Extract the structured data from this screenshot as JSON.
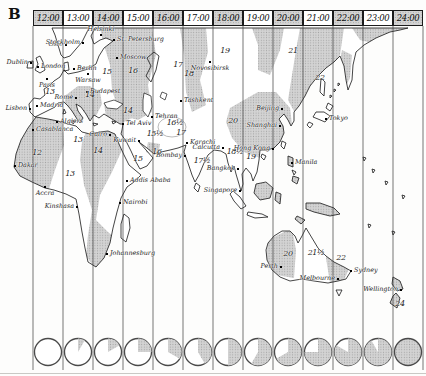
{
  "plate_label": "B",
  "colors": {
    "shade_base": "#d3d3d3",
    "shade_dot": "#a5a5a5",
    "coastline": "#151515",
    "zone_line": "#3a3a3a",
    "clock_ring": "#4a4a4a"
  },
  "timezone_header": {
    "labels": [
      {
        "time": "12:00",
        "shaded": true
      },
      {
        "time": "13:00",
        "shaded": false
      },
      {
        "time": "14:00",
        "shaded": true
      },
      {
        "time": "15:00",
        "shaded": false
      },
      {
        "time": "16:00",
        "shaded": true
      },
      {
        "time": "17:00",
        "shaded": false
      },
      {
        "time": "18:00",
        "shaded": true
      },
      {
        "time": "19:00",
        "shaded": false
      },
      {
        "time": "20:00",
        "shaded": true
      },
      {
        "time": "21:00",
        "shaded": false
      },
      {
        "time": "22:00",
        "shaded": true
      },
      {
        "time": "23:00",
        "shaded": false
      },
      {
        "time": "24:00",
        "shaded": true
      }
    ]
  },
  "map": {
    "cities": [
      {
        "name": "Oslo",
        "x": 66,
        "y": 45,
        "side": "left"
      },
      {
        "name": "Stockholm",
        "x": 83,
        "y": 43,
        "side": "left"
      },
      {
        "name": "Helsinki",
        "x": 101,
        "y": 35,
        "side": "above"
      },
      {
        "name": "St. Petersburg",
        "x": 114,
        "y": 40,
        "side": "right"
      },
      {
        "name": "Moscow",
        "x": 117,
        "y": 58,
        "side": "right"
      },
      {
        "name": "Dublin",
        "x": 31,
        "y": 63,
        "side": "left"
      },
      {
        "name": "London",
        "x": 38,
        "y": 67,
        "side": "right"
      },
      {
        "name": "Berlin",
        "x": 74,
        "y": 69,
        "side": "right"
      },
      {
        "name": "Warsaw",
        "x": 88,
        "y": 74,
        "side": "below"
      },
      {
        "name": "Paris",
        "x": 47,
        "y": 79,
        "side": "below"
      },
      {
        "name": "Budapest",
        "x": 87,
        "y": 92,
        "side": "right"
      },
      {
        "name": "Rome",
        "x": 76,
        "y": 98,
        "side": "left"
      },
      {
        "name": "Madrid",
        "x": 37,
        "y": 106,
        "side": "right"
      },
      {
        "name": "Lisbon",
        "x": 30,
        "y": 109,
        "side": "left"
      },
      {
        "name": "Algiers",
        "x": 57,
        "y": 122,
        "side": "right"
      },
      {
        "name": "Casablanca",
        "x": 33,
        "y": 130,
        "side": "right"
      },
      {
        "name": "Cairo",
        "x": 110,
        "y": 135,
        "side": "left"
      },
      {
        "name": "Tel Aviv",
        "x": 123,
        "y": 124,
        "side": "right"
      },
      {
        "name": "Kuwait",
        "x": 139,
        "y": 141,
        "side": "left"
      },
      {
        "name": "Dakar",
        "x": 15,
        "y": 166,
        "side": "right"
      },
      {
        "name": "Accra",
        "x": 45,
        "y": 187,
        "side": "below"
      },
      {
        "name": "Kinshasa",
        "x": 77,
        "y": 207,
        "side": "left"
      },
      {
        "name": "Nairobi",
        "x": 120,
        "y": 203,
        "side": "right"
      },
      {
        "name": "Addis Ababa",
        "x": 127,
        "y": 181,
        "side": "right"
      },
      {
        "name": "Johannesburg",
        "x": 107,
        "y": 254,
        "side": "right"
      },
      {
        "name": "Tashkent",
        "x": 181,
        "y": 101,
        "side": "right"
      },
      {
        "name": "Tehran",
        "x": 152,
        "y": 117,
        "side": "right"
      },
      {
        "name": "Karachi",
        "x": 187,
        "y": 143,
        "side": "right"
      },
      {
        "name": "Calcutta",
        "x": 223,
        "y": 148,
        "side": "left"
      },
      {
        "name": "Bombay",
        "x": 185,
        "y": 156,
        "side": "left"
      },
      {
        "name": "Bangkok",
        "x": 238,
        "y": 169,
        "side": "left"
      },
      {
        "name": "Singapore",
        "x": 240,
        "y": 191,
        "side": "left"
      },
      {
        "name": "Novosibirsk",
        "x": 210,
        "y": 62,
        "side": "below"
      },
      {
        "name": "Beijing",
        "x": 282,
        "y": 109,
        "side": "left"
      },
      {
        "name": "Shanghai",
        "x": 280,
        "y": 126,
        "side": "left"
      },
      {
        "name": "Hong Kong",
        "x": 273,
        "y": 149,
        "side": "left"
      },
      {
        "name": "Tokyo",
        "x": 326,
        "y": 119,
        "side": "right"
      },
      {
        "name": "Manila",
        "x": 292,
        "y": 163,
        "side": "right"
      },
      {
        "name": "Perth",
        "x": 281,
        "y": 267,
        "side": "left"
      },
      {
        "name": "Sydney",
        "x": 351,
        "y": 271,
        "side": "right"
      },
      {
        "name": "Melbourne",
        "x": 338,
        "y": 279,
        "side": "left"
      },
      {
        "name": "Wellington",
        "x": 401,
        "y": 290,
        "side": "left"
      }
    ],
    "zone_numbers": [
      {
        "label": "12",
        "x": 37,
        "y": 152
      },
      {
        "label": "13",
        "x": 50,
        "y": 91
      },
      {
        "label": "13",
        "x": 78,
        "y": 139
      },
      {
        "label": "13",
        "x": 70,
        "y": 173
      },
      {
        "label": "14",
        "x": 90,
        "y": 94
      },
      {
        "label": "14",
        "x": 128,
        "y": 110
      },
      {
        "label": "14",
        "x": 98,
        "y": 150
      },
      {
        "label": "15",
        "x": 107,
        "y": 71
      },
      {
        "label": "15",
        "x": 138,
        "y": 158
      },
      {
        "label": "15½",
        "x": 155,
        "y": 133
      },
      {
        "label": "16",
        "x": 133,
        "y": 70
      },
      {
        "label": "16",
        "x": 157,
        "y": 151
      },
      {
        "label": "16½",
        "x": 175,
        "y": 122
      },
      {
        "label": "17",
        "x": 178,
        "y": 64
      },
      {
        "label": "17",
        "x": 181,
        "y": 132
      },
      {
        "label": "17½",
        "x": 202,
        "y": 160
      },
      {
        "label": "18",
        "x": 189,
        "y": 73
      },
      {
        "label": "18½",
        "x": 235,
        "y": 151
      },
      {
        "label": "19",
        "x": 225,
        "y": 50
      },
      {
        "label": "19",
        "x": 251,
        "y": 156
      },
      {
        "label": "20",
        "x": 233,
        "y": 120
      },
      {
        "label": "20",
        "x": 288,
        "y": 253
      },
      {
        "label": "21",
        "x": 293,
        "y": 50
      },
      {
        "label": "21½",
        "x": 316,
        "y": 252
      },
      {
        "label": "22",
        "x": 320,
        "y": 77
      },
      {
        "label": "22",
        "x": 341,
        "y": 257
      },
      {
        "label": "24",
        "x": 400,
        "y": 303
      }
    ]
  },
  "clock_row": {
    "clocks": [
      {
        "time": "12:00",
        "twelfths": 0
      },
      {
        "time": "13:00",
        "twelfths": 1
      },
      {
        "time": "14:00",
        "twelfths": 2
      },
      {
        "time": "15:00",
        "twelfths": 3
      },
      {
        "time": "16:00",
        "twelfths": 4
      },
      {
        "time": "17:00",
        "twelfths": 5
      },
      {
        "time": "18:00",
        "twelfths": 6
      },
      {
        "time": "19:00",
        "twelfths": 7
      },
      {
        "time": "20:00",
        "twelfths": 8
      },
      {
        "time": "21:00",
        "twelfths": 9
      },
      {
        "time": "22:00",
        "twelfths": 10
      },
      {
        "time": "23:00",
        "twelfths": 11
      },
      {
        "time": "24:00",
        "twelfths": 12
      }
    ]
  },
  "layout": {
    "first_zone_x": 33,
    "zone_width": 30,
    "zone_count": 13,
    "line_top": 26,
    "line_bottom": 370,
    "clock_cy": 352,
    "clock_r": 13.5
  }
}
